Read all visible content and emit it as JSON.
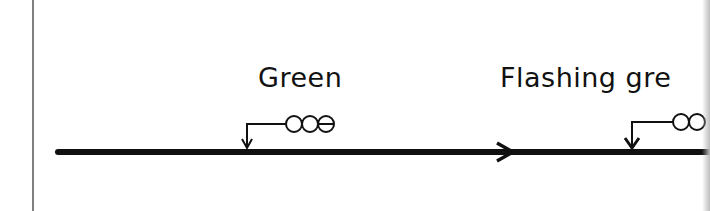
{
  "diagram": {
    "colors": {
      "ink": "#111111",
      "background": "#ffffff",
      "border": "#555555"
    },
    "track": {
      "direction": "right",
      "direction_icon": "arrow-right-icon"
    },
    "signals": [
      {
        "label": "Green",
        "aspect_lamps": [
          "open",
          "open",
          "barred"
        ],
        "icon": "signal-head-icon"
      },
      {
        "label": "Flashing gre",
        "aspect_lamps": [
          "open",
          "open"
        ],
        "icon": "signal-head-icon"
      }
    ]
  }
}
